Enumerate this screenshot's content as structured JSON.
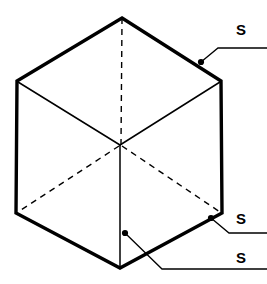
{
  "figure": {
    "background_color": "#ffffff",
    "line_color": "#000000",
    "outline_stroke_width": 3.2,
    "inner_stroke_width": 1.4,
    "leader_stroke_width": 1.2,
    "dash_pattern": "6,5",
    "geometry": {
      "vertices": {
        "top": [
          122,
          18
        ],
        "upper_right": [
          221,
          81
        ],
        "lower_right": [
          222,
          213
        ],
        "bottom": [
          120,
          268
        ],
        "lower_left": [
          16,
          213
        ],
        "upper_left": [
          17,
          81
        ],
        "center": [
          120,
          145
        ]
      },
      "solid_inner_edges": [
        {
          "from": "center",
          "to": "upper_left"
        },
        {
          "from": "center",
          "to": "upper_right"
        },
        {
          "from": "center",
          "to": "bottom"
        }
      ],
      "hidden_inner_edges": [
        {
          "from": "center",
          "to": "top"
        },
        {
          "from": "center",
          "to": "lower_left"
        },
        {
          "from": "center",
          "to": "lower_right"
        }
      ]
    },
    "leaders": [
      {
        "id": "leader-top",
        "label": "S",
        "dot": [
          201,
          62
        ],
        "bend": [
          218,
          48
        ],
        "end": [
          267,
          48
        ],
        "label_position": [
          236,
          22
        ]
      },
      {
        "id": "leader-middle",
        "label": "S",
        "dot": [
          211,
          218
        ],
        "bend": [
          229,
          233
        ],
        "end": [
          267,
          233
        ],
        "label_position": [
          236,
          211
        ]
      },
      {
        "id": "leader-bottom",
        "label": "S",
        "dot": [
          125,
          233
        ],
        "bend": [
          162,
          269
        ],
        "end": [
          267,
          269
        ],
        "label_position": [
          236,
          250
        ]
      }
    ],
    "labels": {
      "surface_top": "S",
      "surface_right": "S",
      "surface_front": "S"
    }
  }
}
